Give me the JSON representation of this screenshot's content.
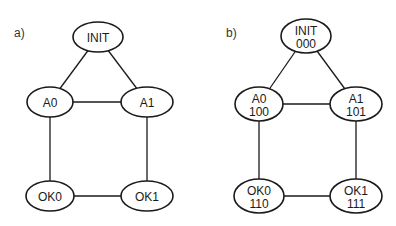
{
  "panels": [
    {
      "label": "a)",
      "label_pos": [
        14,
        37
      ],
      "nodes": [
        {
          "id": "INIT",
          "line1": "INIT",
          "line2": "",
          "cx": 98,
          "cy": 37,
          "rx": 25,
          "ry": 15
        },
        {
          "id": "A0",
          "line1": "A0",
          "line2": "",
          "cx": 50,
          "cy": 102,
          "rx": 23,
          "ry": 15
        },
        {
          "id": "A1",
          "line1": "A1",
          "line2": "",
          "cx": 147,
          "cy": 102,
          "rx": 26,
          "ry": 15
        },
        {
          "id": "OK0",
          "line1": "OK0",
          "line2": "",
          "cx": 50,
          "cy": 196,
          "rx": 24,
          "ry": 15
        },
        {
          "id": "OK1",
          "line1": "OK1",
          "line2": "",
          "cx": 147,
          "cy": 196,
          "rx": 26,
          "ry": 15
        }
      ],
      "edges": [
        [
          "INIT",
          "A0"
        ],
        [
          "INIT",
          "A1"
        ],
        [
          "A0",
          "A1"
        ],
        [
          "A0",
          "OK0"
        ],
        [
          "A1",
          "OK1"
        ],
        [
          "OK0",
          "OK1"
        ]
      ]
    },
    {
      "label": "b)",
      "label_pos": [
        226,
        37
      ],
      "nodes": [
        {
          "id": "INIT",
          "line1": "INIT",
          "line2": "000",
          "cx": 306,
          "cy": 36,
          "rx": 25,
          "ry": 17
        },
        {
          "id": "A0",
          "line1": "A0",
          "line2": "100",
          "cx": 259,
          "cy": 104,
          "rx": 24,
          "ry": 17
        },
        {
          "id": "A1",
          "line1": "A1",
          "line2": "101",
          "cx": 356,
          "cy": 104,
          "rx": 26,
          "ry": 17
        },
        {
          "id": "OK0",
          "line1": "OK0",
          "line2": "110",
          "cx": 259,
          "cy": 196,
          "rx": 25,
          "ry": 17
        },
        {
          "id": "OK1",
          "line1": "OK1",
          "line2": "111",
          "cx": 356,
          "cy": 196,
          "rx": 26,
          "ry": 17
        }
      ],
      "edges": [
        [
          "INIT",
          "A0"
        ],
        [
          "INIT",
          "A1"
        ],
        [
          "A0",
          "A1"
        ],
        [
          "A0",
          "OK0"
        ],
        [
          "A1",
          "OK1"
        ],
        [
          "OK0",
          "OK1"
        ]
      ]
    }
  ],
  "colors": {
    "stroke": "#1a1a1a",
    "fill": "#ffffff",
    "background": "#ffffff"
  }
}
